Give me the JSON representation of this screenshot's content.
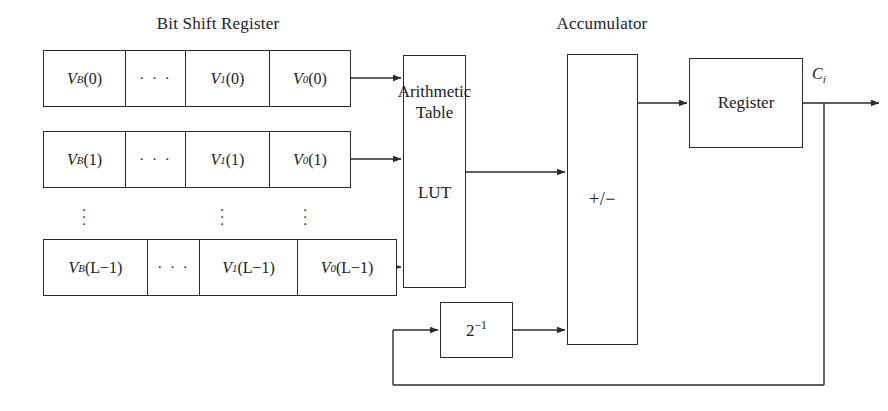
{
  "diagram": {
    "title_bit_shift_register": "Bit Shift Register",
    "title_accumulator": "Accumulator",
    "ellipsis_horizontal": "· · ·",
    "rows": [
      {
        "name": "row-0",
        "cells": [
          "V_B(0)",
          "· · ·",
          "V_1(0)",
          "V_0(0)"
        ],
        "cells_html": [
          "V<sub>B</sub>(0)",
          "· · ·",
          "V<sub>1</sub>(0)",
          "V<sub>0</sub>(0)"
        ]
      },
      {
        "name": "row-1",
        "cells": [
          "V_B(1)",
          "· · ·",
          "V_1(1)",
          "V_0(1)"
        ],
        "cells_html": [
          "V<sub>B</sub>(1)",
          "· · ·",
          "V<sub>1</sub>(1)",
          "V<sub>0</sub>(1)"
        ]
      },
      {
        "name": "row-L-1",
        "cells": [
          "V_B(L−1)",
          "· · ·",
          "V_1(L−1)",
          "V_0(L−1)"
        ],
        "cells_html": [
          "V<sub>B</sub>(L−1)",
          "· · ·",
          "V<sub>1</sub>(L−1)",
          "V<sub>0</sub>(L−1)"
        ]
      }
    ],
    "vertical_ellipsis": "⋮",
    "arithmetic_table": {
      "line1": "Arithmetic",
      "line2": "Table",
      "line3": "LUT"
    },
    "accumulator_block_label": "+/−",
    "shift_block_label": "2⁻¹",
    "shift_block_base": "2",
    "shift_block_exp": "−1",
    "register_label": "Register",
    "output_label": "C_i",
    "output_label_base": "C",
    "output_label_sub": "i",
    "colors": {
      "line": "#2b2b2b",
      "text": "#1a1a1a",
      "background": "#ffffff"
    }
  }
}
